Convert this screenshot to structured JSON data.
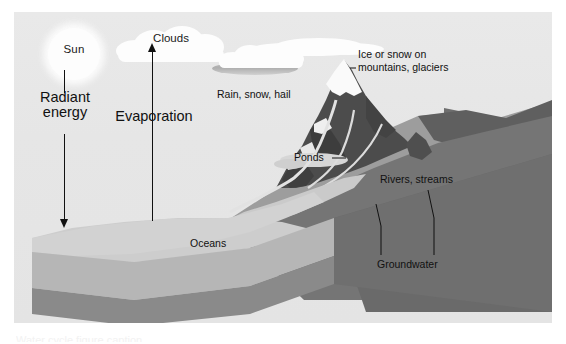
{
  "figure": {
    "type": "labeled-block-diagram"
  },
  "sky": {
    "color": "#e7e7e7"
  },
  "sun": {
    "label": "Sun",
    "color": "#fdfdfd"
  },
  "clouds": {
    "main_label": "Clouds",
    "color": "#fdfdfd"
  },
  "arrows": {
    "radiant": {
      "label": "Radiant energy",
      "direction": "down"
    },
    "evaporation": {
      "label": "Evaporation",
      "direction": "up"
    }
  },
  "labels": {
    "rain": "Rain, snow, hail",
    "ice": "Ice or snow on\nmountains, glaciers",
    "ponds": "Ponds",
    "rivers": "Rivers, streams",
    "oceans": "Oceans",
    "groundwater": "Groundwater"
  },
  "colors": {
    "sky": "#e7e7e7",
    "cloud": "#fdfdfd",
    "ocean_top": "#cfcfcf",
    "ocean_side": "#b4b4b4",
    "rock_side": "#8c8c8c",
    "land_light": "#9a9a9a",
    "land_dark": "#6b6b6b",
    "mountain_dark": "#4a4a4a",
    "snow": "#fafafa",
    "water_feature": "#d2d2d2",
    "text": "#111111"
  },
  "caption_cut": "Water cycle figure caption"
}
